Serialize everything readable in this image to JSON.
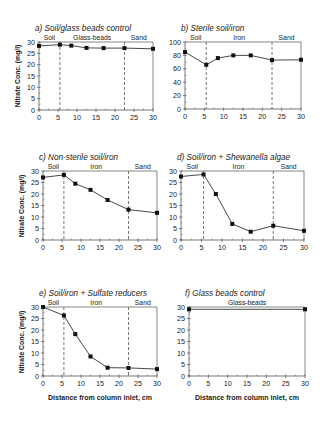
{
  "figure": {
    "y_axis_label": "Nitrate Conc. (mg/l)",
    "x_axis_label": "Distance from column inlet, cm",
    "colors": {
      "line": "#333333",
      "marker": "#111111",
      "axis": "#555555",
      "divider": "#555555"
    }
  },
  "chart_data": [
    {
      "id": "a",
      "type": "line",
      "title": "a) Soil/glass beads control",
      "xlabel": "",
      "ylabel": "Nitrate Conc. (mg/l)",
      "xlim": [
        0,
        30
      ],
      "ylim": [
        0,
        30
      ],
      "xticks": [
        0,
        5,
        10,
        15,
        20,
        25,
        30
      ],
      "yticks": [
        0,
        5,
        10,
        15,
        20,
        25,
        30
      ],
      "regions": [
        {
          "label": "Soil",
          "from": 0,
          "to": 5.5
        },
        {
          "label": "Glass-beads",
          "from": 5.5,
          "to": 22.5
        },
        {
          "label": "Sand",
          "from": 22.5,
          "to": 30
        }
      ],
      "dividers": [
        5.5,
        22.5
      ],
      "series": [
        {
          "name": "Nitrate",
          "x": [
            0,
            5.5,
            8.5,
            12.5,
            17,
            22.5,
            30
          ],
          "y": [
            28.3,
            28.8,
            28.4,
            27.4,
            27.3,
            27.3,
            27.0
          ]
        }
      ],
      "grid": false,
      "layout": {
        "x0": 39,
        "x1": 153,
        "ytop": 42,
        "ybot": 110
      }
    },
    {
      "id": "b",
      "type": "line",
      "title": "b) Sterile soil/iron",
      "xlabel": "",
      "ylabel": "",
      "xlim": [
        0,
        30
      ],
      "ylim": [
        0,
        100
      ],
      "xticks": [
        0,
        5,
        10,
        15,
        20,
        25,
        30
      ],
      "yticks": [
        0,
        20,
        40,
        60,
        80,
        100
      ],
      "regions": [
        {
          "label": "Soil",
          "from": 0,
          "to": 5.5
        },
        {
          "label": "Iron",
          "from": 5.5,
          "to": 22.5
        },
        {
          "label": "Sand",
          "from": 22.5,
          "to": 30
        }
      ],
      "dividers": [
        5.5,
        22.5
      ],
      "series": [
        {
          "name": "Nitrate",
          "x": [
            0,
            5.5,
            8.5,
            12.5,
            17,
            22.5,
            30
          ],
          "y": [
            85,
            66,
            76,
            80,
            80,
            73,
            73.5
          ]
        }
      ],
      "grid": false,
      "layout": {
        "x0": 185,
        "x1": 301,
        "ytop": 42,
        "ybot": 109
      }
    },
    {
      "id": "c",
      "type": "line",
      "title": "c) Non-sterile soil/iron",
      "xlabel": "",
      "ylabel": "Nitrate Conc. (mg/l)",
      "xlim": [
        0,
        30
      ],
      "ylim": [
        0,
        30
      ],
      "xticks": [
        0,
        5,
        10,
        15,
        20,
        25,
        30
      ],
      "yticks": [
        0,
        5,
        10,
        15,
        20,
        25,
        30
      ],
      "regions": [
        {
          "label": "Soil",
          "from": 0,
          "to": 5.5
        },
        {
          "label": "Iron",
          "from": 5.5,
          "to": 22.5
        },
        {
          "label": "Sand",
          "from": 22.5,
          "to": 30
        }
      ],
      "dividers": [
        5.5,
        22.5
      ],
      "series": [
        {
          "name": "Nitrate",
          "x": [
            0,
            5.5,
            8.5,
            12.5,
            17,
            22.5,
            30
          ],
          "y": [
            27.2,
            28.3,
            24.5,
            21.8,
            17.4,
            13.2,
            11.8
          ]
        }
      ],
      "grid": false,
      "layout": {
        "x0": 43,
        "x1": 157,
        "ytop": 171,
        "ybot": 240
      }
    },
    {
      "id": "d",
      "type": "line",
      "title": "d) Soil/iron + Shewanella algae",
      "xlabel": "",
      "ylabel": "",
      "xlim": [
        0,
        30
      ],
      "ylim": [
        0,
        30
      ],
      "xticks": [
        0,
        5,
        10,
        15,
        20,
        25,
        30
      ],
      "yticks": [
        0,
        5,
        10,
        15,
        20,
        25,
        30
      ],
      "regions": [
        {
          "label": "Soil",
          "from": 0,
          "to": 5.5
        },
        {
          "label": "Iron",
          "from": 5.5,
          "to": 22.5
        },
        {
          "label": "Sand",
          "from": 22.5,
          "to": 30
        }
      ],
      "dividers": [
        5.5,
        22.5
      ],
      "series": [
        {
          "name": "Nitrate",
          "x": [
            0,
            5.5,
            8.5,
            12.5,
            17,
            22.5,
            30
          ],
          "y": [
            27.6,
            28.5,
            20.0,
            7.0,
            3.6,
            6.2,
            4.0
          ]
        }
      ],
      "grid": false,
      "layout": {
        "x0": 181,
        "x1": 304,
        "ytop": 171,
        "ybot": 240
      }
    },
    {
      "id": "e",
      "type": "line",
      "title": "e) Soil/iron + Sulfate reducers",
      "xlabel": "Distance from column inlet, cm",
      "ylabel": "Nitrate Conc. (mg/l)",
      "xlim": [
        0,
        30
      ],
      "ylim": [
        0,
        30
      ],
      "xticks": [
        0,
        5,
        10,
        15,
        20,
        25,
        30
      ],
      "yticks": [
        0,
        5,
        10,
        15,
        20,
        25,
        30
      ],
      "regions": [
        {
          "label": "Soil",
          "from": 0,
          "to": 5.5
        },
        {
          "label": "Iron",
          "from": 5.5,
          "to": 22.5
        },
        {
          "label": "Sand",
          "from": 22.5,
          "to": 30
        }
      ],
      "dividers": [
        5.5,
        22.5
      ],
      "series": [
        {
          "name": "Nitrate",
          "x": [
            0,
            5.5,
            8.5,
            12.5,
            17,
            22.5,
            30
          ],
          "y": [
            30.0,
            26.3,
            18.2,
            8.5,
            3.6,
            3.5,
            3.0
          ]
        }
      ],
      "grid": false,
      "layout": {
        "x0": 43,
        "x1": 157,
        "ytop": 307,
        "ybot": 376
      }
    },
    {
      "id": "f",
      "type": "line",
      "title": "f) Glass beads control",
      "xlabel": "Distance from column inlet, cm",
      "ylabel": "",
      "xlim": [
        0,
        30
      ],
      "ylim": [
        0,
        30
      ],
      "xticks": [
        0,
        5,
        10,
        15,
        20,
        25,
        30
      ],
      "yticks": [
        0,
        5,
        10,
        15,
        20,
        25,
        30
      ],
      "regions": [
        {
          "label": "Glass-beads",
          "from": 0,
          "to": 30
        }
      ],
      "dividers": [],
      "series": [
        {
          "name": "Nitrate",
          "x": [
            0,
            30
          ],
          "y": [
            29.0,
            29.0
          ]
        }
      ],
      "grid": false,
      "layout": {
        "x0": 189,
        "x1": 305,
        "ytop": 307,
        "ybot": 376
      }
    }
  ]
}
